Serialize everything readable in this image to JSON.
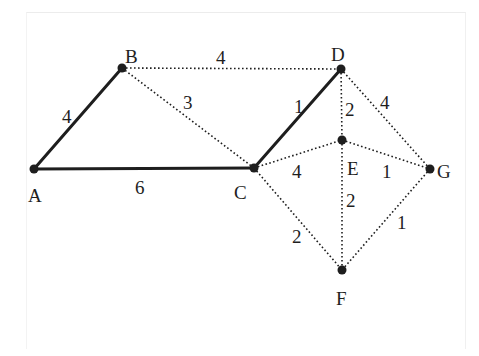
{
  "diagram": {
    "type": "weighted-graph",
    "style": {
      "line_color": "#1e1e1e",
      "solid_width": 3,
      "dotted_width": 1.6,
      "node_radius": 4.5
    },
    "nodes": [
      {
        "id": "A",
        "label": "A",
        "x": 34,
        "y": 169,
        "lx": 28,
        "ly": 202,
        "anchor": "start"
      },
      {
        "id": "B",
        "label": "B",
        "x": 122,
        "y": 68,
        "lx": 125,
        "ly": 63,
        "anchor": "start"
      },
      {
        "id": "C",
        "label": "C",
        "x": 254,
        "y": 168,
        "lx": 234,
        "ly": 199,
        "anchor": "start"
      },
      {
        "id": "D",
        "label": "D",
        "x": 341,
        "y": 69,
        "lx": 331,
        "ly": 61,
        "anchor": "start"
      },
      {
        "id": "E",
        "label": "E",
        "x": 342,
        "y": 140,
        "lx": 347,
        "ly": 175,
        "anchor": "start"
      },
      {
        "id": "F",
        "label": "F",
        "x": 342,
        "y": 270,
        "lx": 336,
        "ly": 305,
        "anchor": "start"
      },
      {
        "id": "G",
        "label": "G",
        "x": 430,
        "y": 169,
        "lx": 437,
        "ly": 178,
        "anchor": "start"
      }
    ],
    "edges": [
      {
        "from": "A",
        "to": "B",
        "weight": "4",
        "style": "solid",
        "wx": 62,
        "wy": 123
      },
      {
        "from": "A",
        "to": "C",
        "weight": "6",
        "style": "solid",
        "wx": 135,
        "wy": 194
      },
      {
        "from": "B",
        "to": "D",
        "weight": "4",
        "style": "dotted",
        "wx": 216,
        "wy": 64
      },
      {
        "from": "B",
        "to": "C",
        "weight": "3",
        "style": "dotted",
        "wx": 183,
        "wy": 109
      },
      {
        "from": "C",
        "to": "D",
        "weight": "1",
        "style": "solid",
        "wx": 294,
        "wy": 113
      },
      {
        "from": "D",
        "to": "E",
        "weight": "2",
        "style": "dotted",
        "wx": 345,
        "wy": 116
      },
      {
        "from": "D",
        "to": "G",
        "weight": "4",
        "style": "dotted",
        "wx": 380,
        "wy": 109
      },
      {
        "from": "C",
        "to": "E",
        "weight": "4",
        "style": "dotted",
        "wx": 292,
        "wy": 178
      },
      {
        "from": "E",
        "to": "G",
        "weight": "1",
        "style": "dotted",
        "wx": 382,
        "wy": 178
      },
      {
        "from": "E",
        "to": "F",
        "weight": "2",
        "style": "dotted",
        "wx": 346,
        "wy": 207
      },
      {
        "from": "C",
        "to": "F",
        "weight": "2",
        "style": "dotted",
        "wx": 292,
        "wy": 243
      },
      {
        "from": "G",
        "to": "F",
        "weight": "1",
        "style": "dotted",
        "wx": 397,
        "wy": 229
      }
    ]
  }
}
